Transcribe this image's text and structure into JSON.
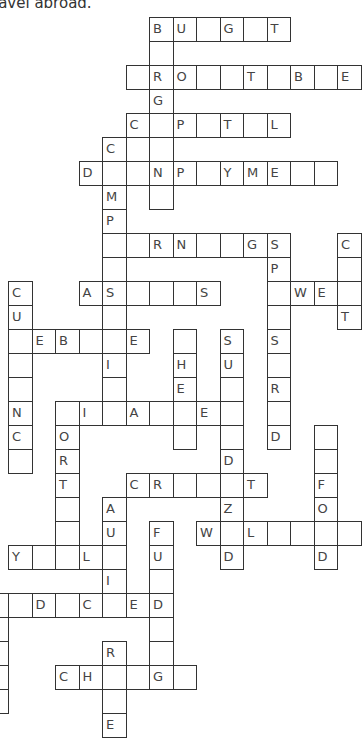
{
  "intro_text": "ravel abroad.",
  "grid": {
    "origin_x": 8,
    "origin_y": 17,
    "cell_w": 23.5,
    "cell_h": 24,
    "rows": [
      {
        "r": 0,
        "cells": [
          [
            6,
            "B"
          ],
          [
            7,
            "U"
          ],
          [
            8,
            ""
          ],
          [
            9,
            "G"
          ],
          [
            10,
            ""
          ],
          [
            11,
            "T"
          ]
        ]
      },
      {
        "r": 1,
        "cells": [
          [
            6,
            ""
          ]
        ]
      },
      {
        "r": 2,
        "cells": [
          [
            5,
            ""
          ],
          [
            6,
            "R"
          ],
          [
            7,
            "O"
          ],
          [
            8,
            ""
          ],
          [
            9,
            ""
          ],
          [
            10,
            "T"
          ],
          [
            11,
            ""
          ],
          [
            12,
            "B"
          ],
          [
            13,
            ""
          ],
          [
            14,
            "E"
          ]
        ]
      },
      {
        "r": 3,
        "cells": [
          [
            6,
            "G"
          ]
        ]
      },
      {
        "r": 4,
        "cells": [
          [
            5,
            "C"
          ],
          [
            6,
            ""
          ],
          [
            7,
            "P"
          ],
          [
            8,
            ""
          ],
          [
            9,
            "T"
          ],
          [
            10,
            ""
          ],
          [
            11,
            "L"
          ]
        ]
      },
      {
        "r": 5,
        "cells": [
          [
            4,
            "C"
          ],
          [
            5,
            ""
          ],
          [
            6,
            ""
          ]
        ]
      },
      {
        "r": 6,
        "cells": [
          [
            3,
            "D"
          ],
          [
            4,
            ""
          ],
          [
            5,
            ""
          ],
          [
            6,
            "N"
          ],
          [
            7,
            "P"
          ],
          [
            8,
            ""
          ],
          [
            9,
            "Y"
          ],
          [
            10,
            "M"
          ],
          [
            11,
            "E"
          ],
          [
            12,
            ""
          ],
          [
            13,
            ""
          ]
        ]
      },
      {
        "r": 7,
        "cells": [
          [
            4,
            "M"
          ],
          [
            6,
            ""
          ]
        ]
      },
      {
        "r": 8,
        "cells": [
          [
            4,
            "P"
          ]
        ]
      },
      {
        "r": 9,
        "cells": [
          [
            4,
            ""
          ],
          [
            5,
            ""
          ],
          [
            6,
            "R"
          ],
          [
            7,
            "N"
          ],
          [
            8,
            ""
          ],
          [
            9,
            ""
          ],
          [
            10,
            "G"
          ],
          [
            11,
            "S"
          ],
          [
            14,
            "C"
          ]
        ]
      },
      {
        "r": 10,
        "cells": [
          [
            4,
            ""
          ],
          [
            11,
            "P"
          ],
          [
            14,
            ""
          ]
        ]
      },
      {
        "r": 11,
        "cells": [
          [
            0,
            "C"
          ],
          [
            3,
            "A"
          ],
          [
            4,
            "S"
          ],
          [
            5,
            ""
          ],
          [
            6,
            ""
          ],
          [
            7,
            ""
          ],
          [
            8,
            "S"
          ],
          [
            11,
            ""
          ],
          [
            12,
            "W"
          ],
          [
            13,
            "E"
          ],
          [
            14,
            ""
          ]
        ]
      },
      {
        "r": 12,
        "cells": [
          [
            0,
            "U"
          ],
          [
            4,
            ""
          ],
          [
            11,
            ""
          ],
          [
            14,
            "T"
          ]
        ]
      },
      {
        "r": 13,
        "cells": [
          [
            0,
            ""
          ],
          [
            1,
            "E"
          ],
          [
            2,
            "B"
          ],
          [
            3,
            ""
          ],
          [
            4,
            ""
          ],
          [
            5,
            "E"
          ],
          [
            7,
            ""
          ],
          [
            9,
            "S"
          ],
          [
            11,
            "S"
          ]
        ]
      },
      {
        "r": 14,
        "cells": [
          [
            0,
            ""
          ],
          [
            4,
            "I"
          ],
          [
            7,
            "H"
          ],
          [
            9,
            "U"
          ],
          [
            11,
            ""
          ]
        ]
      },
      {
        "r": 15,
        "cells": [
          [
            0,
            ""
          ],
          [
            4,
            ""
          ],
          [
            7,
            "E"
          ],
          [
            9,
            ""
          ],
          [
            11,
            "R"
          ]
        ]
      },
      {
        "r": 16,
        "cells": [
          [
            0,
            "N"
          ],
          [
            2,
            ""
          ],
          [
            3,
            "I"
          ],
          [
            4,
            ""
          ],
          [
            5,
            "A"
          ],
          [
            6,
            ""
          ],
          [
            7,
            ""
          ],
          [
            8,
            "E"
          ],
          [
            9,
            ""
          ],
          [
            11,
            ""
          ]
        ]
      },
      {
        "r": 17,
        "cells": [
          [
            0,
            "C"
          ],
          [
            2,
            "O"
          ],
          [
            7,
            ""
          ],
          [
            9,
            ""
          ],
          [
            11,
            "D"
          ],
          [
            13,
            ""
          ]
        ]
      },
      {
        "r": 18,
        "cells": [
          [
            0,
            ""
          ],
          [
            2,
            "R"
          ],
          [
            9,
            "D"
          ],
          [
            13,
            ""
          ]
        ]
      },
      {
        "r": 19,
        "cells": [
          [
            2,
            "T"
          ],
          [
            5,
            "C"
          ],
          [
            6,
            "R"
          ],
          [
            7,
            ""
          ],
          [
            8,
            ""
          ],
          [
            9,
            ""
          ],
          [
            10,
            "T"
          ],
          [
            13,
            "F"
          ]
        ]
      },
      {
        "r": 20,
        "cells": [
          [
            2,
            ""
          ],
          [
            4,
            "A"
          ],
          [
            9,
            "Z"
          ],
          [
            13,
            "O"
          ]
        ]
      },
      {
        "r": 21,
        "cells": [
          [
            2,
            ""
          ],
          [
            4,
            "U"
          ],
          [
            6,
            "F"
          ],
          [
            8,
            "W"
          ],
          [
            9,
            ""
          ],
          [
            10,
            "L"
          ],
          [
            11,
            ""
          ],
          [
            12,
            ""
          ],
          [
            13,
            ""
          ],
          [
            14,
            ""
          ]
        ]
      },
      {
        "r": 22,
        "cells": [
          [
            0,
            "Y"
          ],
          [
            1,
            ""
          ],
          [
            2,
            ""
          ],
          [
            3,
            "L"
          ],
          [
            4,
            ""
          ],
          [
            6,
            "U"
          ],
          [
            9,
            "D"
          ],
          [
            13,
            "D"
          ]
        ]
      },
      {
        "r": 23,
        "cells": [
          [
            4,
            "I"
          ],
          [
            6,
            ""
          ]
        ]
      },
      {
        "r": 24,
        "cells": [
          [
            -1,
            ""
          ],
          [
            0,
            ""
          ],
          [
            1,
            "D"
          ],
          [
            2,
            ""
          ],
          [
            3,
            "C"
          ],
          [
            4,
            ""
          ],
          [
            5,
            "E"
          ],
          [
            6,
            "D"
          ]
        ]
      },
      {
        "r": 25,
        "cells": [
          [
            -1,
            ""
          ],
          [
            6,
            ""
          ]
        ]
      },
      {
        "r": 26,
        "cells": [
          [
            -1,
            ""
          ],
          [
            4,
            "R"
          ],
          [
            6,
            ""
          ]
        ]
      },
      {
        "r": 27,
        "cells": [
          [
            -1,
            ""
          ],
          [
            2,
            "C"
          ],
          [
            3,
            "H"
          ],
          [
            4,
            ""
          ],
          [
            5,
            ""
          ],
          [
            6,
            "G"
          ],
          [
            7,
            ""
          ]
        ]
      },
      {
        "r": 28,
        "cells": [
          [
            -1,
            ""
          ],
          [
            4,
            ""
          ]
        ]
      },
      {
        "r": 29,
        "cells": [
          [
            4,
            "E"
          ]
        ]
      }
    ]
  }
}
